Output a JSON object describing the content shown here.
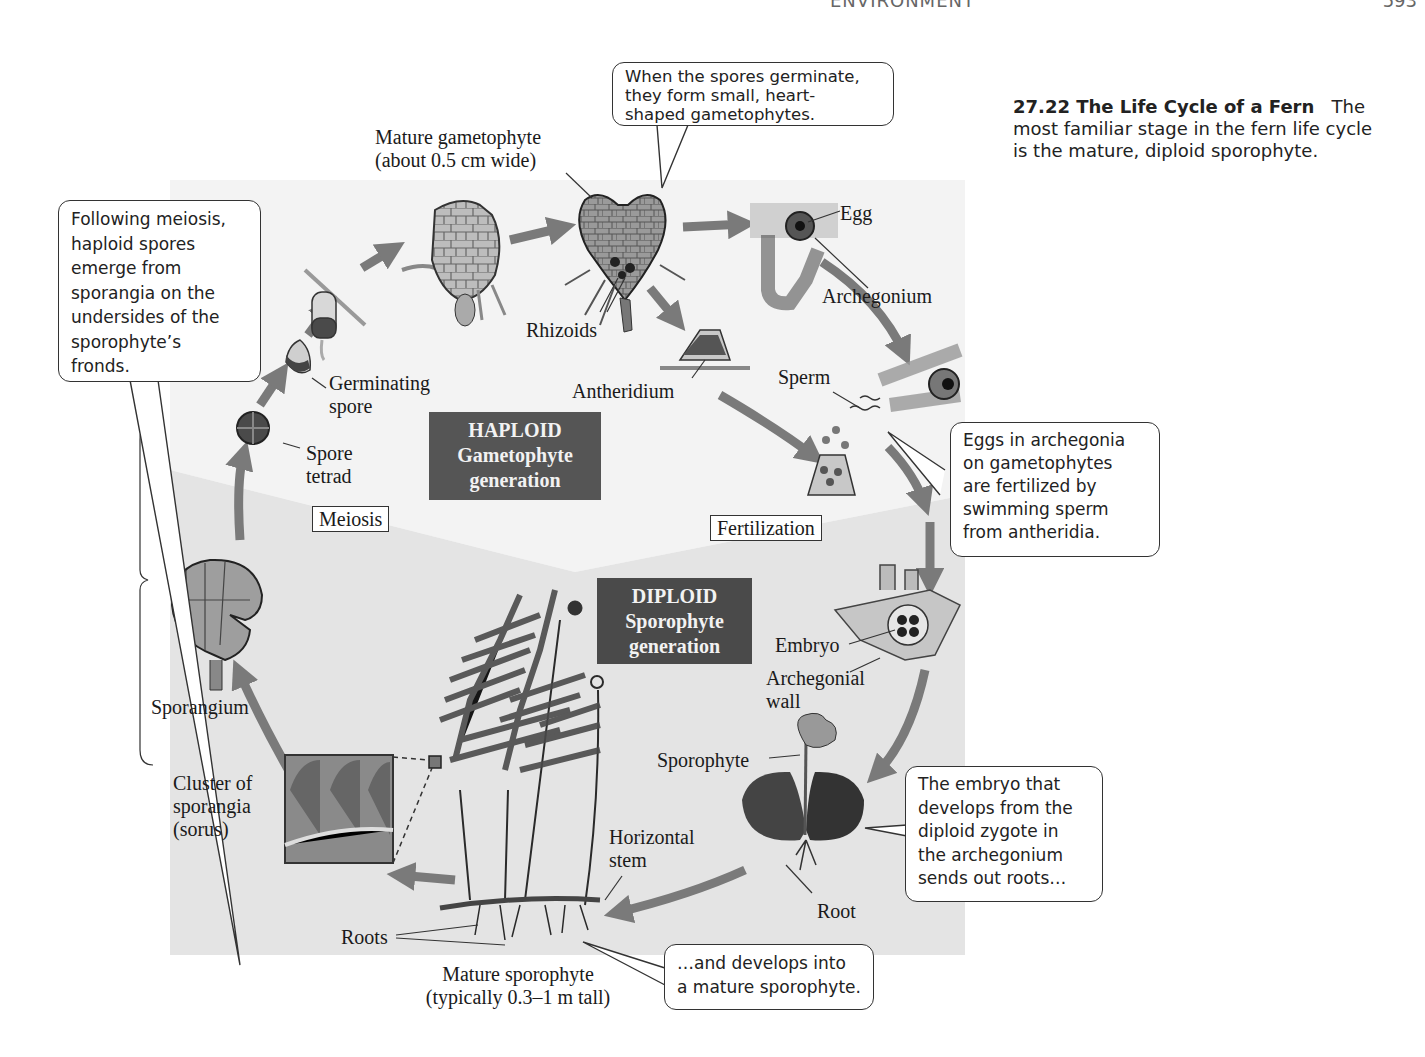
{
  "page_header": {
    "running_title_fragment": "ENVIRONMENT",
    "page_number": "593"
  },
  "caption": {
    "title": "27.22  The Life Cycle of a Fern",
    "line1_rest": "The",
    "line2": "most familiar stage in the fern life cycle",
    "line3": "is the mature, diploid sporophyte."
  },
  "generations": {
    "haploid": {
      "line1": "HAPLOID",
      "line2": "Gametophyte",
      "line3": "generation"
    },
    "diploid": {
      "line1": "DIPLOID",
      "line2": "Sporophyte",
      "line3": "generation"
    }
  },
  "steps": {
    "meiosis": "Meiosis",
    "fertilization": "Fertilization"
  },
  "labels": {
    "mature_gametophyte": {
      "line1": "Mature gametophyte",
      "line2": "(about 0.5 cm wide)"
    },
    "rhizoids": "Rhizoids",
    "antheridium": "Antheridium",
    "egg": "Egg",
    "archegonium": "Archegonium",
    "sperm": "Sperm",
    "germinating_spore": {
      "line1": "Germinating",
      "line2": "spore"
    },
    "spore_tetrad": {
      "line1": "Spore",
      "line2": "tetrad"
    },
    "sporangium": "Sporangium",
    "cluster": {
      "line1": "Cluster of",
      "line2": "sporangia",
      "line3": "(sorus)"
    },
    "embryo": "Embryo",
    "archegonial_wall": {
      "line1": "Archegonial",
      "line2": "wall"
    },
    "sporophyte": "Sporophyte",
    "root": "Root",
    "horizontal_stem": {
      "line1": "Horizontal",
      "line2": "stem"
    },
    "roots": "Roots",
    "mature_sporophyte": {
      "line1": "Mature sporophyte",
      "line2": "(typically 0.3–1 m tall)"
    }
  },
  "callouts": {
    "germinate": [
      "When the spores germinate,",
      "they form small, heart-",
      "shaped gametophytes."
    ],
    "meiosis": [
      "Following meiosis,",
      "haploid spores",
      "emerge from",
      "sporangia on the",
      "undersides of the",
      "sporophyte’s",
      "fronds."
    ],
    "fertilized": [
      "Eggs in archegonia",
      "on gametophytes",
      "are fertilized by",
      "swimming sperm",
      "from antheridia."
    ],
    "embryo": [
      "The embryo that",
      "develops from the",
      "diploid zygote in",
      "the archegonium",
      "sends out roots…"
    ],
    "develops": [
      "…and develops into",
      "a mature sporophyte."
    ]
  },
  "colors": {
    "haploid_bg": "#f4f4f4",
    "diploid_bg": "#e6e6e6",
    "gen_box": "#555555",
    "arrow": "#7a7a7a"
  }
}
